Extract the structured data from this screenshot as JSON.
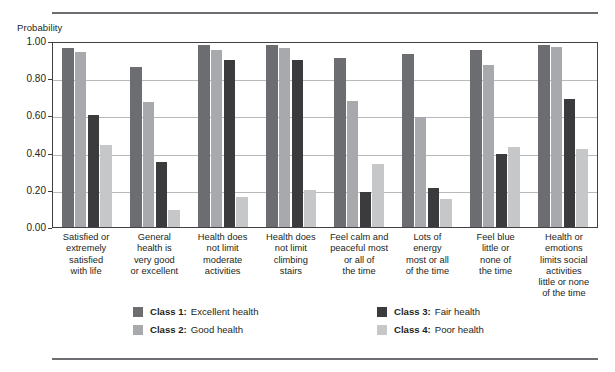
{
  "axis_title": "Probability",
  "legend": {
    "entries": [
      {
        "key": "Class 1:",
        "desc": "Excellent health",
        "color": "#6c6d70",
        "icon": "legend-swatch-icon"
      },
      {
        "key": "Class 2:",
        "desc": "Good health",
        "color": "#a7a9ac",
        "icon": "legend-swatch-icon"
      },
      {
        "key": "Class 3:",
        "desc": "Fair health",
        "color": "#3b3b3d",
        "icon": "legend-swatch-icon"
      },
      {
        "key": "Class 4:",
        "desc": "Poor health",
        "color": "#c6c7c9",
        "icon": "legend-swatch-icon"
      }
    ]
  },
  "chart_data": {
    "type": "bar",
    "title": "",
    "xlabel": "",
    "ylabel": "Probability",
    "ylim": [
      0,
      1.0
    ],
    "yticks": [
      "0.00",
      "0.20",
      "0.40",
      "0.60",
      "0.80",
      "1.00"
    ],
    "ytick_values": [
      0.0,
      0.2,
      0.4,
      0.6,
      0.8,
      1.0
    ],
    "grid": true,
    "legend_position": "bottom",
    "categories": [
      "Satisfied or extremely satisfied with life",
      "General health is very good or excellent",
      "Health does not limit moderate activities",
      "Health does not limit climbing stairs",
      "Feel calm and peaceful most or all of the time",
      "Lots of energy most or all of the time",
      "Feel blue little or none of the time",
      "Health or emotions limits social activities little or none of the time"
    ],
    "category_lines": [
      [
        "Satisfied or",
        "extremely",
        "satisfied",
        "with life"
      ],
      [
        "General",
        "health is",
        "very good",
        "or excellent"
      ],
      [
        "Health does",
        "not limit",
        "moderate",
        "activities"
      ],
      [
        "Health does",
        "not limit",
        "climbing",
        "stairs"
      ],
      [
        "Feel calm and",
        "peaceful most",
        "or all of",
        "the time"
      ],
      [
        "Lots of",
        "energy",
        "most or all",
        "of the time"
      ],
      [
        "Feel blue",
        "little or",
        "none of",
        "the time"
      ],
      [
        "Health or",
        "emotions",
        "limits social",
        "activities",
        "little or none",
        "of the time"
      ]
    ],
    "series": [
      {
        "name": "Class 1: Excellent health",
        "color": "#6c6d70",
        "values": [
          0.96,
          0.86,
          0.98,
          0.98,
          0.91,
          0.93,
          0.95,
          0.98
        ]
      },
      {
        "name": "Class 2: Good health",
        "color": "#a7a9ac",
        "values": [
          0.94,
          0.67,
          0.95,
          0.96,
          0.68,
          0.59,
          0.87,
          0.97
        ]
      },
      {
        "name": "Class 3: Fair health",
        "color": "#3b3b3d",
        "values": [
          0.6,
          0.35,
          0.9,
          0.9,
          0.19,
          0.21,
          0.39,
          0.69
        ]
      },
      {
        "name": "Class 4: Poor health",
        "color": "#c6c7c9",
        "values": [
          0.44,
          0.09,
          0.16,
          0.2,
          0.34,
          0.15,
          0.43,
          0.42
        ]
      }
    ]
  }
}
